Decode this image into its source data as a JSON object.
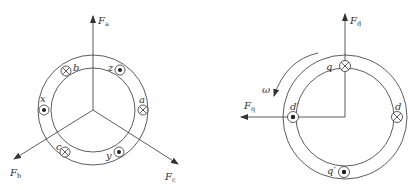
{
  "diagram_left": {
    "title": "three-phase winding",
    "forces": [
      {
        "id": "Fa",
        "main": "F",
        "sub": "a"
      },
      {
        "id": "Fb",
        "main": "F",
        "sub": "b"
      },
      {
        "id": "Fc",
        "main": "F",
        "sub": "c"
      }
    ],
    "conductors": [
      {
        "label": "b",
        "symbol": "cross"
      },
      {
        "label": "z",
        "symbol": "dot"
      },
      {
        "label": "x",
        "symbol": "dot"
      },
      {
        "label": "a",
        "symbol": "cross"
      },
      {
        "label": "c",
        "symbol": "cross"
      },
      {
        "label": "y",
        "symbol": "dot"
      }
    ]
  },
  "diagram_right": {
    "title": "dq equivalent winding",
    "forces": [
      {
        "id": "Fd",
        "main": "F",
        "sub": "d"
      },
      {
        "id": "Fq",
        "main": "F",
        "sub": "q"
      }
    ],
    "rotation": {
      "label": "ω"
    },
    "conductors": [
      {
        "label": "q",
        "symbol": "cross"
      },
      {
        "label": "d′",
        "symbol": "dot"
      },
      {
        "label": "d",
        "symbol": "cross"
      },
      {
        "label": "q′",
        "symbol": "dot"
      }
    ]
  },
  "colors": {
    "stroke": "#333333",
    "background": "#ffffff"
  }
}
